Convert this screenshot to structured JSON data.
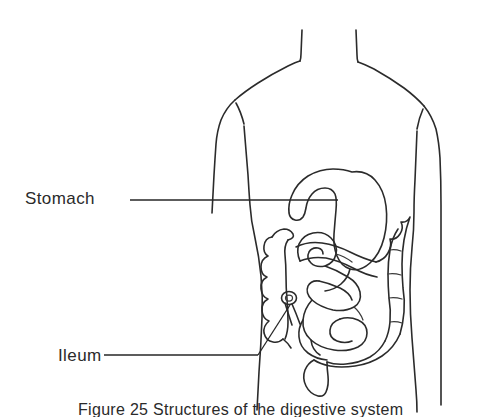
{
  "figure": {
    "caption": "Figure 25  Structures of the digestive system",
    "background_color": "#ffffff",
    "line_color": "#2b2b2b"
  },
  "labels": [
    {
      "id": "stomach",
      "text": "Stomach",
      "leader": "horizontal line from label to stomach organ"
    },
    {
      "id": "ileum",
      "text": "Ileum",
      "leader": "line from label angling up-right to ileum / ileocecal region"
    }
  ],
  "anatomy": {
    "body_outline": "torso-outline",
    "organs": [
      "stomach",
      "small-intestine-ileum",
      "ascending-colon",
      "transverse-colon",
      "descending-colon",
      "sigmoid-colon",
      "cecum-appendix",
      "rectum"
    ]
  }
}
